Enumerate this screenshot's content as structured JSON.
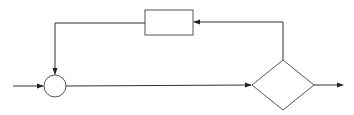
{
  "diagram": {
    "type": "block-diagram-feedback-loop",
    "colors": {
      "line": "#333333",
      "shape_border": "#555555",
      "background": "#ffffff"
    },
    "nodes": [
      {
        "id": "summing-junction",
        "shape": "circle",
        "label": ""
      },
      {
        "id": "feedback-block",
        "shape": "rectangle",
        "label": ""
      },
      {
        "id": "decision",
        "shape": "diamond",
        "label": ""
      }
    ],
    "edges": [
      {
        "from": "input",
        "to": "summing-junction"
      },
      {
        "from": "summing-junction",
        "to": "decision"
      },
      {
        "from": "decision",
        "to": "output"
      },
      {
        "from": "decision",
        "to": "feedback-block"
      },
      {
        "from": "feedback-block",
        "to": "summing-junction"
      }
    ]
  }
}
